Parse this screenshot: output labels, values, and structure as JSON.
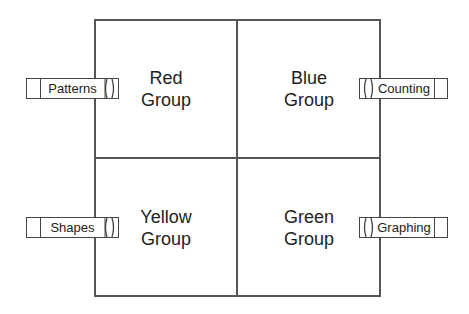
{
  "groups": {
    "top_left": {
      "line1": "Red",
      "line2": "Group"
    },
    "top_right": {
      "line1": "Blue",
      "line2": "Group"
    },
    "bottom_left": {
      "line1": "Yellow",
      "line2": "Group"
    },
    "bottom_right": {
      "line1": "Green",
      "line2": "Group"
    }
  },
  "labels": {
    "top_left": "Patterns",
    "top_right": "Counting",
    "bottom_left": "Shapes",
    "bottom_right": "Graphing"
  },
  "colors": {
    "line": "#555555",
    "text": "#222222"
  }
}
